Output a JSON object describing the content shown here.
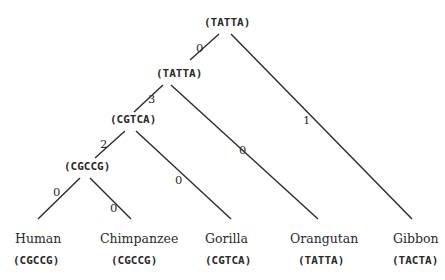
{
  "tree": {
    "internal_nodes": [
      {
        "id": "root",
        "seq": "(TATTA)"
      },
      {
        "id": "n1",
        "seq": "(TATTA)"
      },
      {
        "id": "n2",
        "seq": "(CGTCA)"
      },
      {
        "id": "n3",
        "seq": "(CGCCG)"
      }
    ],
    "leaves": [
      {
        "name": "Human",
        "seq": "(CGCCG)"
      },
      {
        "name": "Chimpanzee",
        "seq": "(CGCCG)"
      },
      {
        "name": "Gorilla",
        "seq": "(CGTCA)"
      },
      {
        "name": "Orangutan",
        "seq": "(TATTA)"
      },
      {
        "name": "Gibbon",
        "seq": "(TACTA)"
      }
    ],
    "edges": [
      {
        "from": "root",
        "to": "n1",
        "weight": "0"
      },
      {
        "from": "root",
        "to": "Gibbon",
        "weight": "1"
      },
      {
        "from": "n1",
        "to": "n2",
        "weight": "3"
      },
      {
        "from": "n1",
        "to": "Orangutan",
        "weight": "0"
      },
      {
        "from": "n2",
        "to": "n3",
        "weight": "2"
      },
      {
        "from": "n2",
        "to": "Gorilla",
        "weight": "0"
      },
      {
        "from": "n3",
        "to": "Human",
        "weight": "0"
      },
      {
        "from": "n3",
        "to": "Chimpanzee",
        "weight": "0"
      }
    ]
  }
}
